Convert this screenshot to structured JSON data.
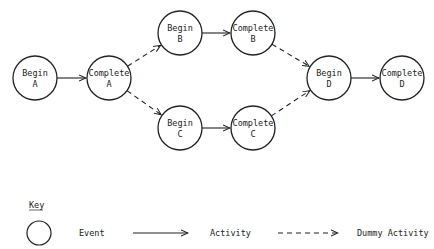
{
  "diagram": {
    "type": "activity-on-arrow network",
    "nodes": [
      {
        "id": "beginA",
        "line1": "Begin",
        "line2": "A",
        "cx": 35,
        "cy": 78
      },
      {
        "id": "completeA",
        "line1": "Complete",
        "line2": "A",
        "cx": 109,
        "cy": 78
      },
      {
        "id": "beginB",
        "line1": "Begin",
        "line2": "B",
        "cx": 180,
        "cy": 33
      },
      {
        "id": "completeB",
        "line1": "Complete",
        "line2": "B",
        "cx": 253,
        "cy": 33
      },
      {
        "id": "beginC",
        "line1": "Begin",
        "line2": "C",
        "cx": 180,
        "cy": 128
      },
      {
        "id": "completeC",
        "line1": "Complete",
        "line2": "C",
        "cx": 253,
        "cy": 128
      },
      {
        "id": "beginD",
        "line1": "Begin",
        "line2": "D",
        "cx": 329,
        "cy": 78
      },
      {
        "id": "completeD",
        "line1": "Complete",
        "line2": "D",
        "cx": 402,
        "cy": 78
      }
    ],
    "edges": [
      {
        "from": "beginA",
        "to": "completeA",
        "kind": "activity"
      },
      {
        "from": "completeA",
        "to": "beginB",
        "kind": "dummy"
      },
      {
        "from": "completeA",
        "to": "beginC",
        "kind": "dummy"
      },
      {
        "from": "beginB",
        "to": "completeB",
        "kind": "activity"
      },
      {
        "from": "beginC",
        "to": "completeC",
        "kind": "activity"
      },
      {
        "from": "completeB",
        "to": "beginD",
        "kind": "dummy"
      },
      {
        "from": "completeC",
        "to": "beginD",
        "kind": "dummy"
      },
      {
        "from": "beginD",
        "to": "completeD",
        "kind": "activity"
      }
    ]
  },
  "key": {
    "title": "Key",
    "event_label": "Event",
    "activity_label": "Activity",
    "dummy_label": "Dummy Activity"
  }
}
